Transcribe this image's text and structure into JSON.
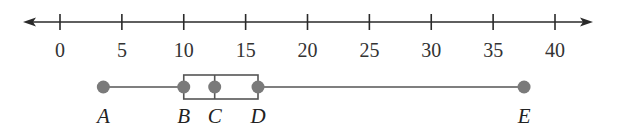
{
  "figure": {
    "type": "box-and-whisker plot on number line",
    "colors": {
      "axis": "#2a2a2a",
      "box": "#555555",
      "point": "#7a7a7a",
      "text": "#333333"
    }
  },
  "number_line": {
    "min": 0,
    "max": 40,
    "step": 5,
    "ticks": [
      "0",
      "5",
      "10",
      "15",
      "20",
      "25",
      "30",
      "35",
      "40"
    ],
    "arrows": "both"
  },
  "box_plot": {
    "points": [
      {
        "label": "A",
        "value": 3.5,
        "role": "minimum"
      },
      {
        "label": "B",
        "value": 10,
        "role": "lower quartile"
      },
      {
        "label": "C",
        "value": 12.5,
        "role": "median"
      },
      {
        "label": "D",
        "value": 16,
        "role": "upper quartile"
      },
      {
        "label": "E",
        "value": 37.5,
        "role": "maximum"
      }
    ]
  }
}
